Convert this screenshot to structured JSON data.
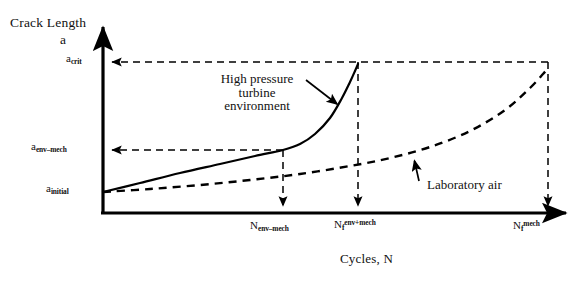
{
  "figure": {
    "y_axis_title_line1": "Crack Length",
    "y_axis_title_line2": "a",
    "x_axis_title": "Cycles, N",
    "y_ticks": [
      {
        "name": "a-crit",
        "base": "a",
        "sub": "crit",
        "value_y": 62
      },
      {
        "name": "a-env-mech",
        "base": "a",
        "sub": "env–mech",
        "value_y": 150
      },
      {
        "name": "a-initial",
        "base": "a",
        "sub": "initial",
        "value_y": 192
      }
    ],
    "x_ticks": [
      {
        "name": "N-env-mech",
        "base": "N",
        "sub": "env–mech",
        "sup": "",
        "value_x": 283
      },
      {
        "name": "Nf-env-plus-mech",
        "base": "N",
        "sub": "f",
        "sup": "env+mech",
        "value_x": 358
      },
      {
        "name": "Nf-mech",
        "base": "N",
        "sub": "f",
        "sup": "mech",
        "value_x": 548
      }
    ],
    "annotations": [
      {
        "name": "high-pressure-turbine",
        "text": "High pressure\nturbine\nenvironment",
        "line1": "High pressure",
        "line2": "turbine",
        "line3": "environment"
      },
      {
        "name": "laboratory-air",
        "text": "Laboratory air"
      }
    ],
    "colors": {
      "ink": "#000000",
      "background": "#ffffff",
      "curve_solid": "#000000",
      "curve_dashed": "#000000"
    }
  },
  "chart_data": {
    "type": "line",
    "title": "",
    "xlabel": "Cycles, N",
    "ylabel": "Crack Length a",
    "grid": false,
    "legend_position": "inline-annotations",
    "x_tick_labels": [
      "N_env–mech",
      "N_f^env+mech",
      "N_f^mech"
    ],
    "x_tick_pixels": [
      283,
      358,
      548
    ],
    "y_tick_labels": [
      "a_initial",
      "a_env–mech",
      "a_crit"
    ],
    "y_tick_pixels": [
      192,
      150,
      62
    ],
    "axis_origin_pixel": [
      103,
      213
    ],
    "axis_x_arrow_tip_pixel": [
      572,
      213
    ],
    "axis_y_arrow_tip_pixel": [
      103,
      22
    ],
    "series": [
      {
        "name": "High pressure turbine environment",
        "style": "solid",
        "points_pixel": [
          [
            103,
            192
          ],
          [
            140,
            183
          ],
          [
            180,
            173
          ],
          [
            220,
            164
          ],
          [
            255,
            156
          ],
          [
            283,
            150
          ],
          [
            300,
            144
          ],
          [
            315,
            134
          ],
          [
            330,
            118
          ],
          [
            342,
            98
          ],
          [
            350,
            82
          ],
          [
            355,
            71
          ],
          [
            358,
            64
          ]
        ]
      },
      {
        "name": "Laboratory air",
        "style": "dashed",
        "points_pixel": [
          [
            103,
            192
          ],
          [
            150,
            189
          ],
          [
            200,
            185
          ],
          [
            250,
            180
          ],
          [
            300,
            174
          ],
          [
            350,
            166
          ],
          [
            390,
            158
          ],
          [
            430,
            147
          ],
          [
            470,
            131
          ],
          [
            505,
            110
          ],
          [
            530,
            88
          ],
          [
            543,
            74
          ],
          [
            548,
            68
          ]
        ]
      }
    ],
    "guide_lines": [
      {
        "name": "a-crit-horizontal",
        "from_pixel": [
          548,
          62
        ],
        "to_pixel": [
          108,
          62
        ],
        "style": "dashed",
        "arrow": "left"
      },
      {
        "name": "a-env-mech-horizontal",
        "from_pixel": [
          283,
          150
        ],
        "to_pixel": [
          108,
          150
        ],
        "style": "dashed",
        "arrow": "left"
      },
      {
        "name": "n-env-mech-vertical",
        "from_pixel": [
          283,
          150
        ],
        "to_pixel": [
          283,
          210
        ],
        "style": "dashed",
        "arrow": "down"
      },
      {
        "name": "nf-env-mech-vertical",
        "from_pixel": [
          358,
          62
        ],
        "to_pixel": [
          358,
          210
        ],
        "style": "dashed",
        "arrow": "down"
      },
      {
        "name": "nf-mech-vertical",
        "from_pixel": [
          548,
          62
        ],
        "to_pixel": [
          548,
          210
        ],
        "style": "dashed",
        "arrow": "down"
      }
    ],
    "callouts": [
      {
        "name": "hpt-arrow",
        "from_pixel": [
          306,
          80
        ],
        "to_pixel": [
          339,
          106
        ],
        "style": "solid",
        "arrow": "end"
      },
      {
        "name": "lab-air-arrow",
        "from_pixel": [
          419,
          181
        ],
        "to_pixel": [
          414,
          159
        ],
        "style": "solid",
        "arrow": "end"
      }
    ]
  }
}
